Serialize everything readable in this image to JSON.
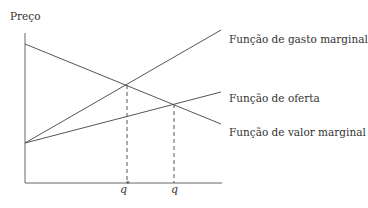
{
  "diagram": {
    "y_axis_label": "Preço",
    "curves": [
      {
        "name": "marginal-expenditure",
        "label": "Função de gasto marginal",
        "from": [
          25,
          143
        ],
        "to": [
          221,
          30
        ]
      },
      {
        "name": "supply",
        "label": "Função de oferta",
        "from": [
          25,
          143
        ],
        "to": [
          221,
          92
        ]
      },
      {
        "name": "marginal-value",
        "label": "Função de valor marginal",
        "from": [
          25,
          44
        ],
        "to": [
          221,
          124
        ]
      }
    ],
    "x_markers": [
      {
        "label": "q",
        "superscript": "*",
        "x": 127,
        "y": 85
      },
      {
        "label": "q",
        "x": 174,
        "y": 104
      }
    ],
    "line_color": "#555555"
  }
}
